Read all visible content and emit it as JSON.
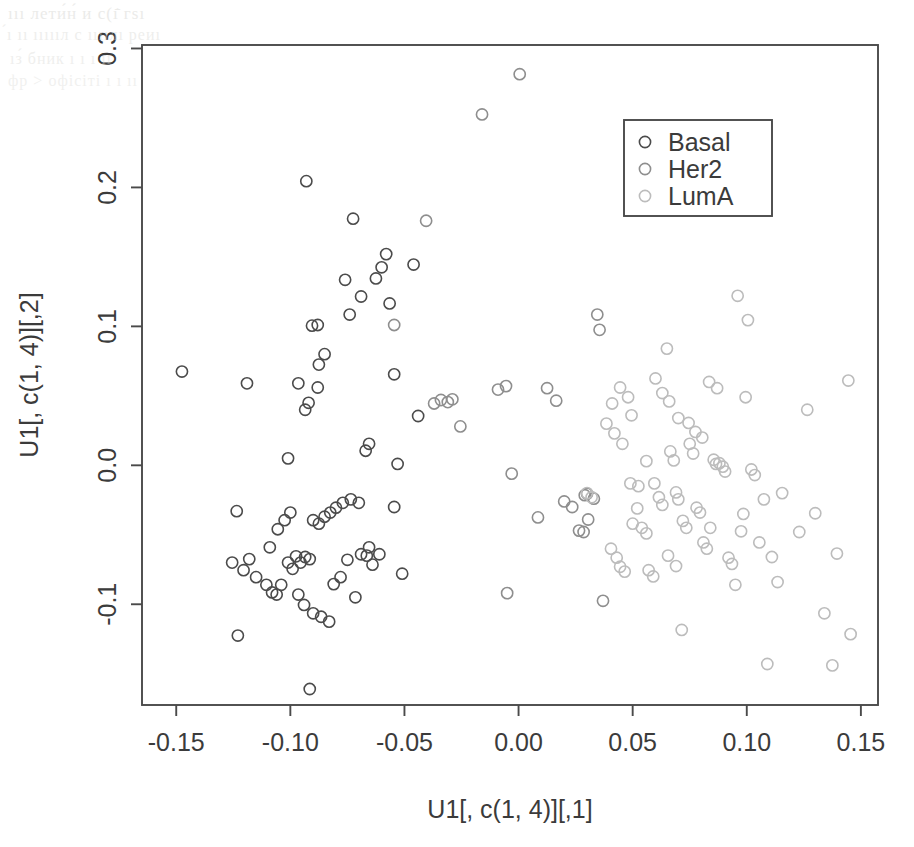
{
  "figure": {
    "background": "#ffffff",
    "plot_area": {
      "left": 142,
      "top": 45,
      "right": 878,
      "bottom": 705
    },
    "axis_color": "#4a4a4a",
    "text_color": "#3b3b3b"
  },
  "scan_artifacts": {
    "note": "faint bleed-through text from reverse page, illegible",
    "lines": [
      {
        "text": "ııı лети́н́ и с(ı̄̇ гѕı",
        "x": 8,
        "y": 4,
        "size": 17,
        "opacity": 0.5
      },
      {
        "text": "́ı ıı ıııııл с ııııлı реиı",
        "x": 6,
        "y": 26,
        "size": 16,
        "opacity": 0.42
      },
      {
        "text": "ıз́ бник ı ı ı ıı",
        "x": 10,
        "y": 50,
        "size": 16,
        "opacity": 0.4
      },
      {
        "text": "фр > офісіті ı ı ıı",
        "x": 8,
        "y": 72,
        "size": 16,
        "opacity": 0.36
      }
    ]
  },
  "chart_data": {
    "type": "scatter",
    "title": "",
    "xlabel": "U1[, c(1, 4)][,1]",
    "ylabel": "U1[, c(1, 4)][,2]",
    "xlim": [
      -0.165,
      0.1575
    ],
    "ylim": [
      -0.1725,
      0.3025
    ],
    "xticks": [
      -0.15,
      -0.1,
      -0.05,
      0.0,
      0.05,
      0.1,
      0.15
    ],
    "xtick_labels": [
      "-0.15",
      "-0.10",
      "-0.05",
      "0.00",
      "0.05",
      "0.10",
      "0.15"
    ],
    "yticks": [
      -0.1,
      0.0,
      0.1,
      0.2,
      0.3
    ],
    "ytick_labels": [
      "-0.1",
      "0.0",
      "0.1",
      "0.2",
      "0.3"
    ],
    "grid": false,
    "marker": {
      "shape": "open-circle",
      "radius": 5.6,
      "stroke_width": 1.6
    },
    "legend": {
      "position": "top-right",
      "box": {
        "x": 624,
        "y": 120,
        "width": 148,
        "height": 96
      },
      "entries": [
        {
          "name": "Basal",
          "color": "#4b4b4b"
        },
        {
          "name": "Her2",
          "color": "#8e8e8e"
        },
        {
          "name": "LumA",
          "color": "#bcbcbc"
        }
      ]
    },
    "series": [
      {
        "name": "Basal",
        "color": "#4b4b4b",
        "points": [
          [
            -0.1475,
            0.0675
          ],
          [
            -0.1235,
            -0.033
          ],
          [
            -0.1255,
            -0.07
          ],
          [
            -0.1205,
            -0.0755
          ],
          [
            -0.118,
            -0.0675
          ],
          [
            -0.115,
            -0.0805
          ],
          [
            -0.123,
            -0.1225
          ],
          [
            -0.1105,
            -0.086
          ],
          [
            -0.108,
            -0.0915
          ],
          [
            -0.106,
            -0.093
          ],
          [
            -0.104,
            -0.086
          ],
          [
            -0.109,
            -0.059
          ],
          [
            -0.1055,
            -0.046
          ],
          [
            -0.1025,
            -0.0395
          ],
          [
            -0.1,
            -0.034
          ],
          [
            -0.101,
            -0.07
          ],
          [
            -0.099,
            -0.0745
          ],
          [
            -0.0975,
            -0.0655
          ],
          [
            -0.0955,
            -0.07
          ],
          [
            -0.0935,
            -0.066
          ],
          [
            -0.0915,
            -0.0675
          ],
          [
            -0.0965,
            -0.093
          ],
          [
            -0.094,
            -0.1005
          ],
          [
            -0.09,
            -0.1065
          ],
          [
            -0.0865,
            -0.109
          ],
          [
            -0.083,
            -0.1125
          ],
          [
            -0.0915,
            -0.161
          ],
          [
            -0.09,
            -0.0395
          ],
          [
            -0.0875,
            -0.042
          ],
          [
            -0.085,
            -0.037
          ],
          [
            -0.0825,
            -0.034
          ],
          [
            -0.08,
            -0.0305
          ],
          [
            -0.077,
            -0.027
          ],
          [
            -0.0735,
            -0.0245
          ],
          [
            -0.07,
            -0.027
          ],
          [
            -0.0665,
            -0.065
          ],
          [
            -0.064,
            -0.0715
          ],
          [
            -0.061,
            -0.064
          ],
          [
            -0.081,
            -0.0855
          ],
          [
            -0.078,
            -0.0805
          ],
          [
            -0.075,
            -0.068
          ],
          [
            -0.0715,
            -0.095
          ],
          [
            -0.069,
            -0.064
          ],
          [
            -0.0655,
            -0.059
          ],
          [
            -0.0545,
            -0.03
          ],
          [
            -0.051,
            -0.078
          ],
          [
            -0.101,
            0.005
          ],
          [
            -0.0965,
            0.059
          ],
          [
            -0.0935,
            0.04
          ],
          [
            -0.092,
            0.045
          ],
          [
            -0.0905,
            0.1005
          ],
          [
            -0.088,
            0.101
          ],
          [
            -0.0875,
            0.0725
          ],
          [
            -0.085,
            0.08
          ],
          [
            -0.076,
            0.1335
          ],
          [
            -0.074,
            0.1085
          ],
          [
            -0.0725,
            0.1775
          ],
          [
            -0.069,
            0.1215
          ],
          [
            -0.067,
            0.0105
          ],
          [
            -0.0655,
            0.0155
          ],
          [
            -0.0625,
            0.1345
          ],
          [
            -0.06,
            0.1425
          ],
          [
            -0.058,
            0.152
          ],
          [
            -0.0565,
            0.1165
          ],
          [
            -0.0545,
            0.0655
          ],
          [
            -0.053,
            0.001
          ],
          [
            -0.046,
            0.1445
          ],
          [
            -0.044,
            0.0355
          ],
          [
            -0.093,
            0.2045
          ],
          [
            -0.119,
            0.059
          ],
          [
            -0.088,
            0.056
          ]
        ]
      },
      {
        "name": "Her2",
        "color": "#8e8e8e",
        "points": [
          [
            -0.0405,
            0.176
          ],
          [
            -0.037,
            0.0445
          ],
          [
            -0.034,
            0.047
          ],
          [
            -0.031,
            0.0455
          ],
          [
            -0.029,
            0.0475
          ],
          [
            -0.0255,
            0.028
          ],
          [
            -0.016,
            0.2525
          ],
          [
            0.0005,
            0.2815
          ],
          [
            -0.009,
            0.0545
          ],
          [
            -0.0055,
            0.057
          ],
          [
            -0.003,
            -0.006
          ],
          [
            -0.005,
            -0.092
          ],
          [
            0.0085,
            -0.0375
          ],
          [
            0.0125,
            0.0555
          ],
          [
            0.0165,
            0.0465
          ],
          [
            0.02,
            -0.026
          ],
          [
            0.0235,
            -0.03
          ],
          [
            0.0265,
            -0.047
          ],
          [
            0.029,
            -0.0215
          ],
          [
            0.03,
            -0.0205
          ],
          [
            0.033,
            -0.024
          ],
          [
            0.0345,
            0.1085
          ],
          [
            0.0355,
            0.0975
          ],
          [
            0.037,
            -0.0975
          ],
          [
            0.0305,
            -0.039
          ],
          [
            0.0285,
            -0.048
          ],
          [
            -0.0545,
            0.101
          ]
        ]
      },
      {
        "name": "LumA",
        "color": "#bcbcbc",
        "points": [
          [
            0.0405,
            -0.06
          ],
          [
            0.043,
            -0.0665
          ],
          [
            0.0445,
            -0.073
          ],
          [
            0.0465,
            -0.0765
          ],
          [
            0.048,
            0.049
          ],
          [
            0.0495,
            0.036
          ],
          [
            0.05,
            -0.042
          ],
          [
            0.052,
            -0.031
          ],
          [
            0.054,
            -0.045
          ],
          [
            0.056,
            -0.049
          ],
          [
            0.057,
            -0.0755
          ],
          [
            0.059,
            -0.08
          ],
          [
            0.06,
            0.0625
          ],
          [
            0.0615,
            -0.023
          ],
          [
            0.063,
            -0.0285
          ],
          [
            0.065,
            0.084
          ],
          [
            0.0665,
            0.01
          ],
          [
            0.068,
            0.0035
          ],
          [
            0.069,
            -0.0195
          ],
          [
            0.07,
            -0.0245
          ],
          [
            0.0715,
            -0.1185
          ],
          [
            0.072,
            -0.04
          ],
          [
            0.0735,
            -0.045
          ],
          [
            0.075,
            0.0155
          ],
          [
            0.0765,
            0.0085
          ],
          [
            0.078,
            -0.0305
          ],
          [
            0.0795,
            -0.034
          ],
          [
            0.081,
            -0.0555
          ],
          [
            0.0825,
            -0.06
          ],
          [
            0.084,
            -0.045
          ],
          [
            0.0855,
            0.004
          ],
          [
            0.0865,
            0.001
          ],
          [
            0.088,
            0.0015
          ],
          [
            0.0895,
            -0.001
          ],
          [
            0.0905,
            -0.0045
          ],
          [
            0.092,
            -0.0665
          ],
          [
            0.0935,
            -0.071
          ],
          [
            0.095,
            -0.086
          ],
          [
            0.096,
            0.122
          ],
          [
            0.0975,
            -0.0475
          ],
          [
            0.0985,
            -0.035
          ],
          [
            0.0995,
            0.049
          ],
          [
            0.1005,
            0.1045
          ],
          [
            0.102,
            -0.003
          ],
          [
            0.1035,
            -0.007
          ],
          [
            0.1055,
            -0.0555
          ],
          [
            0.1075,
            -0.0245
          ],
          [
            0.109,
            -0.143
          ],
          [
            0.111,
            -0.066
          ],
          [
            0.1135,
            -0.084
          ],
          [
            0.1155,
            -0.02
          ],
          [
            0.123,
            -0.048
          ],
          [
            0.1265,
            0.04
          ],
          [
            0.13,
            -0.0345
          ],
          [
            0.134,
            -0.1065
          ],
          [
            0.1375,
            -0.144
          ],
          [
            0.1395,
            -0.0635
          ],
          [
            0.1445,
            0.061
          ],
          [
            0.1455,
            -0.1215
          ],
          [
            0.0385,
            0.03
          ],
          [
            0.042,
            0.023
          ],
          [
            0.0455,
            0.0155
          ],
          [
            0.049,
            -0.013
          ],
          [
            0.0525,
            -0.015
          ],
          [
            0.056,
            0.003
          ],
          [
            0.0595,
            -0.013
          ],
          [
            0.063,
            0.052
          ],
          [
            0.066,
            0.046
          ],
          [
            0.07,
            0.034
          ],
          [
            0.0745,
            0.0305
          ],
          [
            0.0775,
            0.024
          ],
          [
            0.0805,
            0.02
          ],
          [
            0.0835,
            0.06
          ],
          [
            0.087,
            0.0555
          ],
          [
            0.03,
            -0.02
          ],
          [
            0.032,
            -0.023
          ],
          [
            0.041,
            0.0445
          ],
          [
            0.0445,
            0.056
          ],
          [
            0.0655,
            -0.065
          ],
          [
            0.069,
            -0.0725
          ]
        ]
      }
    ]
  }
}
